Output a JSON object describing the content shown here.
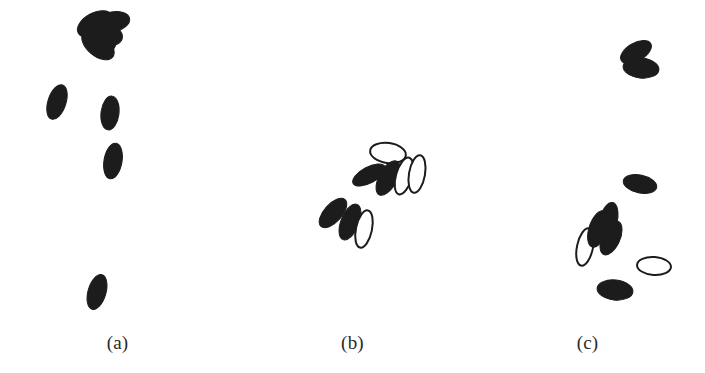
{
  "figure": {
    "width": 705,
    "height": 373,
    "background_color": "#ffffff",
    "filled_color": "#1c1c1c",
    "outline_color": "#1c1c1c",
    "outline_fill_color": "#ffffff",
    "label_color": "#2a2a2a"
  },
  "panels": [
    {
      "id": "a",
      "label": "(a)",
      "x": 0,
      "width": 235,
      "shapes": [
        {
          "name": "filled-ellipse",
          "style": "filled",
          "cx": 95,
          "cy": 24,
          "rx": 11,
          "ry": 19,
          "rot": 62
        },
        {
          "name": "filled-ellipse",
          "style": "filled",
          "cx": 102,
          "cy": 33,
          "rx": 12,
          "ry": 21,
          "rot": 106
        },
        {
          "name": "filled-ellipse",
          "style": "filled",
          "cx": 112,
          "cy": 22,
          "rx": 10,
          "ry": 18,
          "rot": 78
        },
        {
          "name": "filled-ellipse",
          "style": "filled",
          "cx": 98,
          "cy": 45,
          "rx": 11,
          "ry": 19,
          "rot": 130
        },
        {
          "name": "filled-ellipse",
          "style": "filled",
          "cx": 107,
          "cy": 40,
          "rx": 10,
          "ry": 17,
          "rot": 20
        },
        {
          "name": "filled-ellipse",
          "style": "filled",
          "cx": 57,
          "cy": 102,
          "rx": 9,
          "ry": 18,
          "rot": 18
        },
        {
          "name": "filled-ellipse",
          "style": "filled",
          "cx": 110,
          "cy": 113,
          "rx": 9,
          "ry": 17,
          "rot": 7
        },
        {
          "name": "filled-ellipse",
          "style": "filled",
          "cx": 113,
          "cy": 161,
          "rx": 9,
          "ry": 18,
          "rot": 10
        },
        {
          "name": "filled-ellipse",
          "style": "filled",
          "cx": 97,
          "cy": 292,
          "rx": 9,
          "ry": 18,
          "rot": 16
        }
      ]
    },
    {
      "id": "b",
      "label": "(b)",
      "x": 235,
      "width": 235,
      "shapes": [
        {
          "name": "outlined-ellipse",
          "style": "outlined",
          "cx": 388,
          "cy": 153,
          "rx": 18,
          "ry": 10,
          "rot": 8
        },
        {
          "name": "filled-ellipse",
          "style": "filled",
          "cx": 369,
          "cy": 175,
          "rx": 8,
          "ry": 18,
          "rot": 62
        },
        {
          "name": "filled-ellipse",
          "style": "filled",
          "cx": 388,
          "cy": 178,
          "rx": 9,
          "ry": 19,
          "rot": 28
        },
        {
          "name": "outlined-ellipse",
          "style": "outlined",
          "cx": 404,
          "cy": 176,
          "rx": 8,
          "ry": 19,
          "rot": 16
        },
        {
          "name": "outlined-ellipse",
          "style": "outlined",
          "cx": 417,
          "cy": 174,
          "rx": 8,
          "ry": 19,
          "rot": 10
        },
        {
          "name": "filled-ellipse",
          "style": "filled",
          "cx": 333,
          "cy": 213,
          "rx": 9,
          "ry": 18,
          "rot": 42
        },
        {
          "name": "filled-ellipse",
          "style": "filled",
          "cx": 350,
          "cy": 222,
          "rx": 9,
          "ry": 19,
          "rot": 22
        },
        {
          "name": "outlined-ellipse",
          "style": "outlined",
          "cx": 364,
          "cy": 229,
          "rx": 8,
          "ry": 19,
          "rot": 12
        }
      ]
    },
    {
      "id": "c",
      "label": "(c)",
      "x": 470,
      "width": 235,
      "shapes": [
        {
          "name": "filled-ellipse",
          "style": "filled",
          "cx": 636,
          "cy": 52,
          "rx": 9,
          "ry": 17,
          "rot": 60
        },
        {
          "name": "filled-ellipse",
          "style": "filled",
          "cx": 641,
          "cy": 68,
          "rx": 10,
          "ry": 18,
          "rot": 96
        },
        {
          "name": "filled-ellipse",
          "style": "filled",
          "cx": 640,
          "cy": 184,
          "rx": 17,
          "ry": 9,
          "rot": 12
        },
        {
          "name": "outlined-ellipse",
          "style": "outlined",
          "cx": 585,
          "cy": 247,
          "rx": 8,
          "ry": 19,
          "rot": 12
        },
        {
          "name": "filled-ellipse",
          "style": "filled",
          "cx": 598,
          "cy": 229,
          "rx": 9,
          "ry": 19,
          "rot": 18
        },
        {
          "name": "filled-ellipse",
          "style": "filled",
          "cx": 608,
          "cy": 222,
          "rx": 9,
          "ry": 20,
          "rot": 14
        },
        {
          "name": "filled-ellipse",
          "style": "filled",
          "cx": 611,
          "cy": 238,
          "rx": 9,
          "ry": 18,
          "rot": 24
        },
        {
          "name": "outlined-ellipse",
          "style": "outlined",
          "cx": 654,
          "cy": 266,
          "rx": 17,
          "ry": 9,
          "rot": 4
        },
        {
          "name": "filled-ellipse",
          "style": "filled",
          "cx": 615,
          "cy": 290,
          "rx": 18,
          "ry": 10,
          "rot": 6
        }
      ]
    }
  ],
  "chart_data": {
    "type": "scatter",
    "title": "",
    "xlabel": "",
    "ylabel": "",
    "legend": [
      {
        "label": "filled ellipse",
        "color": "#1c1c1c"
      },
      {
        "label": "outlined ellipse",
        "color": "#ffffff"
      }
    ],
    "series": [
      {
        "name": "(a)",
        "values": [
          {
            "x": 95,
            "y": 24,
            "rx": 11,
            "ry": 19,
            "rot": 62,
            "style": "filled"
          },
          {
            "x": 102,
            "y": 33,
            "rx": 12,
            "ry": 21,
            "rot": 106,
            "style": "filled"
          },
          {
            "x": 112,
            "y": 22,
            "rx": 10,
            "ry": 18,
            "rot": 78,
            "style": "filled"
          },
          {
            "x": 98,
            "y": 45,
            "rx": 11,
            "ry": 19,
            "rot": 130,
            "style": "filled"
          },
          {
            "x": 107,
            "y": 40,
            "rx": 10,
            "ry": 17,
            "rot": 20,
            "style": "filled"
          },
          {
            "x": 57,
            "y": 102,
            "rx": 9,
            "ry": 18,
            "rot": 18,
            "style": "filled"
          },
          {
            "x": 110,
            "y": 113,
            "rx": 9,
            "ry": 17,
            "rot": 7,
            "style": "filled"
          },
          {
            "x": 113,
            "y": 161,
            "rx": 9,
            "ry": 18,
            "rot": 10,
            "style": "filled"
          },
          {
            "x": 97,
            "y": 292,
            "rx": 9,
            "ry": 18,
            "rot": 16,
            "style": "filled"
          }
        ]
      },
      {
        "name": "(b)",
        "values": [
          {
            "x": 388,
            "y": 153,
            "rx": 18,
            "ry": 10,
            "rot": 8,
            "style": "outlined"
          },
          {
            "x": 369,
            "y": 175,
            "rx": 8,
            "ry": 18,
            "rot": 62,
            "style": "filled"
          },
          {
            "x": 388,
            "y": 178,
            "rx": 9,
            "ry": 19,
            "rot": 28,
            "style": "filled"
          },
          {
            "x": 404,
            "y": 176,
            "rx": 8,
            "ry": 19,
            "rot": 16,
            "style": "outlined"
          },
          {
            "x": 417,
            "y": 174,
            "rx": 8,
            "ry": 19,
            "rot": 10,
            "style": "outlined"
          },
          {
            "x": 333,
            "y": 213,
            "rx": 9,
            "ry": 18,
            "rot": 42,
            "style": "filled"
          },
          {
            "x": 350,
            "y": 222,
            "rx": 9,
            "ry": 19,
            "rot": 22,
            "style": "filled"
          },
          {
            "x": 364,
            "y": 229,
            "rx": 8,
            "ry": 19,
            "rot": 12,
            "style": "outlined"
          }
        ]
      },
      {
        "name": "(c)",
        "values": [
          {
            "x": 636,
            "y": 52,
            "rx": 9,
            "ry": 17,
            "rot": 60,
            "style": "filled"
          },
          {
            "x": 641,
            "y": 68,
            "rx": 10,
            "ry": 18,
            "rot": 96,
            "style": "filled"
          },
          {
            "x": 640,
            "y": 184,
            "rx": 17,
            "ry": 9,
            "rot": 12,
            "style": "filled"
          },
          {
            "x": 585,
            "y": 247,
            "rx": 8,
            "ry": 19,
            "rot": 12,
            "style": "outlined"
          },
          {
            "x": 598,
            "y": 229,
            "rx": 9,
            "ry": 19,
            "rot": 18,
            "style": "filled"
          },
          {
            "x": 608,
            "y": 222,
            "rx": 9,
            "ry": 20,
            "rot": 14,
            "style": "filled"
          },
          {
            "x": 611,
            "y": 238,
            "rx": 9,
            "ry": 18,
            "rot": 24,
            "style": "filled"
          },
          {
            "x": 654,
            "y": 266,
            "rx": 17,
            "ry": 9,
            "rot": 4,
            "style": "outlined"
          },
          {
            "x": 615,
            "y": 290,
            "rx": 18,
            "ry": 10,
            "rot": 6,
            "style": "filled"
          }
        ]
      }
    ]
  }
}
